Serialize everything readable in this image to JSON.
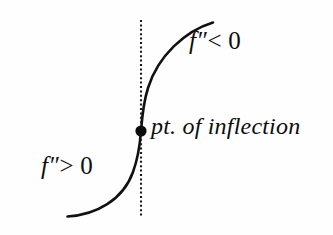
{
  "figure": {
    "background_color": "#fefefe",
    "ink_color": "#111111"
  },
  "labels": {
    "concave_down": {
      "function": "f",
      "prime": "″",
      "relation": "< 0",
      "full_text": "f″< 0"
    },
    "concave_up": {
      "function": "f",
      "prime": "″",
      "relation": "> 0",
      "full_text": "f″> 0"
    },
    "inflection_point": {
      "full_text": "pt. of inflection"
    }
  },
  "chart_data": {
    "type": "line",
    "xlabel": "",
    "ylabel": "",
    "grid": false,
    "legend": "none",
    "annotations": [
      {
        "name": "concave-down-region",
        "text": "f″< 0",
        "x": 189,
        "y": 40
      },
      {
        "name": "concave-up-region",
        "text": "f″> 0",
        "x": 41,
        "y": 172
      },
      {
        "name": "inflection-label",
        "text": "pt. of inflection",
        "x": 151,
        "y": 131
      }
    ],
    "markers": [
      {
        "name": "inflection-point",
        "x": 141,
        "y": 131,
        "radius": 5.6,
        "filled": true
      }
    ],
    "guides": [
      {
        "name": "vertical-dotted-guide",
        "orientation": "vertical",
        "x": 141,
        "y_start": 20,
        "y_end": 216,
        "style": "dotted"
      }
    ],
    "curve": {
      "name": "sigmoid-curve",
      "stroke_width": 2.6,
      "path": "M 67.5 216.5 C 96 215 123 200 133 172 C 138.5 157 140 144 141 131 C 142 118 143.5 102 148 88 C 158 56 185 31 213 22.5",
      "points": [
        {
          "x": 67.5,
          "y": 216.5
        },
        {
          "x": 100,
          "y": 212
        },
        {
          "x": 120,
          "y": 198
        },
        {
          "x": 132,
          "y": 175
        },
        {
          "x": 138,
          "y": 152
        },
        {
          "x": 141,
          "y": 131
        },
        {
          "x": 145,
          "y": 104
        },
        {
          "x": 153,
          "y": 80
        },
        {
          "x": 170,
          "y": 52
        },
        {
          "x": 190,
          "y": 33
        },
        {
          "x": 213,
          "y": 22.5
        }
      ]
    }
  }
}
